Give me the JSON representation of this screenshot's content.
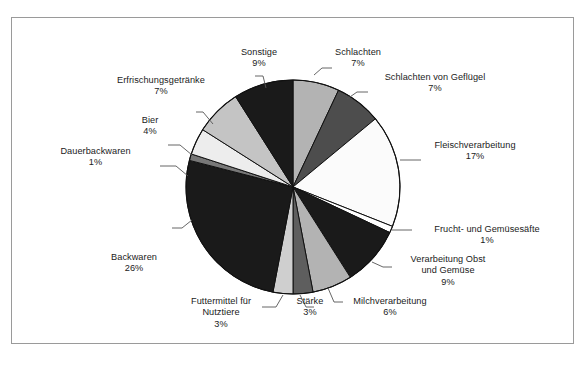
{
  "chart_data": {
    "type": "pie",
    "title": "",
    "subtitle": "",
    "xlabel": "",
    "ylabel": "",
    "legend_position": "none",
    "grid": false,
    "unit": "%",
    "start_angle_deg": 0,
    "direction": "clockwise",
    "categories": [
      "Schlachten",
      "Schlachten von Geflügel",
      "Fleischverarbeitung",
      "Frucht- und Gemüsesäfte",
      "Verarbeitung Obst und Gemüse",
      "Milchverarbeitung",
      "Stärke",
      "Futtermittel für Nutztiere",
      "Backwaren",
      "Dauerbackwaren",
      "Bier",
      "Erfrischungsgetränke",
      "Sonstige"
    ],
    "values": [
      7,
      7,
      17,
      1,
      9,
      6,
      3,
      3,
      26,
      1,
      4,
      7,
      9
    ],
    "slice_colors": [
      "#b3b3b3",
      "#4d4d4d",
      "#fbfbfb",
      "#ffffff",
      "#1a1a1a",
      "#b3b3b3",
      "#5e5e5e",
      "#cfcfcf",
      "#1a1a1a",
      "#787878",
      "#ededed",
      "#c4c4c4",
      "#1a1a1a"
    ],
    "slices": [
      {
        "label": "Schlachten",
        "value": 7,
        "value_text": "7%",
        "color": "#b3b3b3"
      },
      {
        "label": "Schlachten von Geflügel",
        "value": 7,
        "value_text": "7%",
        "color": "#4d4d4d"
      },
      {
        "label": "Fleischverarbeitung",
        "value": 17,
        "value_text": "17%",
        "color": "#fbfbfb"
      },
      {
        "label": "Frucht- und Gemüsesäfte",
        "value": 1,
        "value_text": "1%",
        "color": "#ffffff"
      },
      {
        "label": "Verarbeitung Obst und Gemüse",
        "value": 9,
        "value_text": "9%",
        "color": "#1a1a1a"
      },
      {
        "label": "Milchverarbeitung",
        "value": 6,
        "value_text": "6%",
        "color": "#b3b3b3"
      },
      {
        "label": "Stärke",
        "value": 3,
        "value_text": "3%",
        "color": "#5e5e5e"
      },
      {
        "label": "Futtermittel für Nutztiere",
        "value": 3,
        "value_text": "3%",
        "color": "#cfcfcf"
      },
      {
        "label": "Backwaren",
        "value": 26,
        "value_text": "26%",
        "color": "#1a1a1a"
      },
      {
        "label": "Dauerbackwaren",
        "value": 1,
        "value_text": "1%",
        "color": "#787878"
      },
      {
        "label": "Bier",
        "value": 4,
        "value_text": "4%",
        "color": "#ededed"
      },
      {
        "label": "Erfrischungsgetränke",
        "value": 7,
        "value_text": "7%",
        "color": "#c4c4c4"
      },
      {
        "label": "Sonstige",
        "value": 9,
        "value_text": "9%",
        "color": "#1a1a1a"
      }
    ]
  },
  "labels": {
    "sonstige": {
      "name": "Sonstige",
      "pct": "9%"
    },
    "schlachten": {
      "name": "Schlachten",
      "pct": "7%"
    },
    "gefluegel": {
      "name": "Schlachten von Geflügel",
      "pct": "7%"
    },
    "erfrischungsgetraenke": {
      "name": "Erfrischungsgetränke",
      "pct": "7%"
    },
    "fleischverarbeitung": {
      "name": "Fleischverarbeitung",
      "pct": "17%"
    },
    "bier": {
      "name": "Bier",
      "pct": "4%"
    },
    "dauerbackwaren": {
      "name": "Dauerbackwaren",
      "pct": "1%"
    },
    "saefte": {
      "name": "Frucht- und Gemüsesäfte",
      "pct": "1%"
    },
    "obst_gemuese": {
      "name_line1": "Verarbeitung Obst",
      "name_line2": "und Gemüse",
      "pct": "9%"
    },
    "backwaren": {
      "name": "Backwaren",
      "pct": "26%"
    },
    "milch": {
      "name": "Milchverarbeitung",
      "pct": "6%"
    },
    "staerke": {
      "name": "Stärke",
      "pct": "3%"
    },
    "futtermittel": {
      "name_line1": "Futtermittel für",
      "name_line2": "Nutztiere",
      "pct": "3%"
    }
  },
  "colors": {
    "frame_border": "#9a9a9a",
    "text": "#1b1b1b",
    "leader_line": "#555555",
    "background": "#ffffff"
  }
}
